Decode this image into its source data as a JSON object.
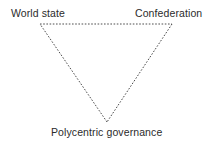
{
  "figure": {
    "name": "governance-triangle",
    "background_color": "#ffffff",
    "line_color": "#3a3a3a",
    "text_color": "#2b2b2b",
    "line_style": "dashed"
  },
  "labels": {
    "top_left": "World state",
    "top_right": "Confederation",
    "bottom": "Polycentric governance"
  },
  "chart_data": {
    "type": "diagram",
    "shape": "inverted-triangle",
    "title": "",
    "vertices": [
      {
        "id": "world-state",
        "label": "World state",
        "x": 40,
        "y": 24
      },
      {
        "id": "confederation",
        "label": "Confederation",
        "x": 172,
        "y": 24
      },
      {
        "id": "polycentric-governance",
        "label": "Polycentric governance",
        "x": 107,
        "y": 122
      }
    ],
    "edges": [
      {
        "from": "world-state",
        "to": "confederation",
        "style": "dashed"
      },
      {
        "from": "confederation",
        "to": "polycentric-governance",
        "style": "dashed"
      },
      {
        "from": "polycentric-governance",
        "to": "world-state",
        "style": "dashed"
      }
    ],
    "legend": [],
    "annotations": []
  }
}
